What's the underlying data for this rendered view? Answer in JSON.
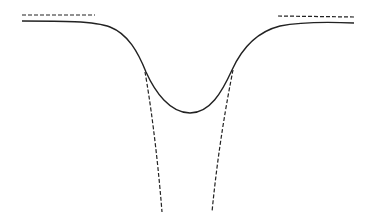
{
  "figure": {
    "colors": {
      "stroke": "#222222",
      "background": "#ffffff"
    },
    "solid_curve": {
      "path": "M22,21 C60,21 95,21 110,27 C128,34 138,52 146,72 C155,92 170,113 190,113 C210,113 222,92 232,70 C242,48 256,32 280,26 C300,22 330,22 354,23"
    },
    "dashed_asymptotes": [
      {
        "x1": 22,
        "y1": 15,
        "x2": 95,
        "y2": 15
      },
      {
        "x1": 278,
        "y1": 16,
        "x2": 354,
        "y2": 17
      }
    ],
    "dashed_branches": [
      {
        "path": "M145,72 C150,100 157,150 162,212"
      },
      {
        "path": "M233,70 C227,100 218,150 212,212"
      }
    ]
  }
}
